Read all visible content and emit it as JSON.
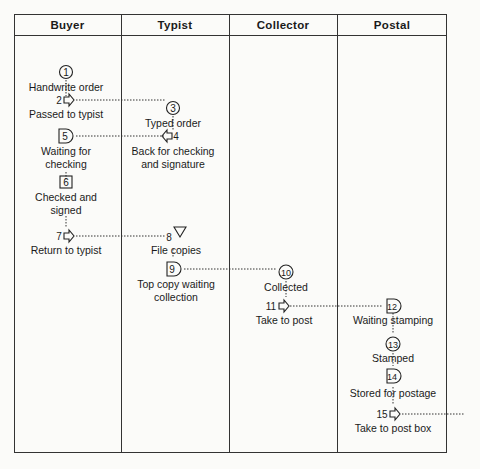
{
  "columns": [
    "Buyer",
    "Typist",
    "Collector",
    "Postal"
  ],
  "steps": [
    {
      "n": "1",
      "symbol": "operation",
      "label": "Handwrite order",
      "lane": "Buyer"
    },
    {
      "n": "2",
      "symbol": "transport",
      "label": "Passed to typist",
      "lane": "Buyer"
    },
    {
      "n": "3",
      "symbol": "operation",
      "label": "Typed order",
      "lane": "Typist"
    },
    {
      "n": "4",
      "symbol": "transport",
      "label": "Back for checking and signature",
      "lane": "Typist"
    },
    {
      "n": "5",
      "symbol": "delay",
      "label": "Waiting for checking",
      "lane": "Buyer"
    },
    {
      "n": "6",
      "symbol": "inspection",
      "label": "Checked and signed",
      "lane": "Buyer"
    },
    {
      "n": "7",
      "symbol": "transport",
      "label": "Return to typist",
      "lane": "Buyer"
    },
    {
      "n": "8",
      "symbol": "storage",
      "label": "File copies",
      "lane": "Typist"
    },
    {
      "n": "9",
      "symbol": "delay",
      "label": "Top copy waiting collection",
      "lane": "Typist"
    },
    {
      "n": "10",
      "symbol": "operation",
      "label": "Collected",
      "lane": "Collector"
    },
    {
      "n": "11",
      "symbol": "transport",
      "label": "Take to post",
      "lane": "Collector"
    },
    {
      "n": "12",
      "symbol": "delay",
      "label": "Waiting stamping",
      "lane": "Postal"
    },
    {
      "n": "13",
      "symbol": "operation",
      "label": "Stamped",
      "lane": "Postal"
    },
    {
      "n": "14",
      "symbol": "delay",
      "label": "Stored for postage",
      "lane": "Postal"
    },
    {
      "n": "15",
      "symbol": "transport",
      "label": "Take to post box",
      "lane": "Postal"
    }
  ],
  "labels": {
    "l1": "Handwrite order",
    "l2": "Passed to typist",
    "l3": "Typed order",
    "l4a": "Back for checking",
    "l4b": "and signature",
    "l5a": "Waiting for",
    "l5b": "checking",
    "l6a": "Checked and",
    "l6b": "signed",
    "l7": "Return to typist",
    "l8": "File copies",
    "l9a": "Top copy waiting",
    "l9b": "collection",
    "l10": "Collected",
    "l11": "Take to post",
    "l12": "Waiting stamping",
    "l13": "Stamped",
    "l14": "Stored for postage",
    "l15": "Take to post box"
  },
  "numbers": {
    "n1": "1",
    "n2": "2",
    "n3": "3",
    "n4": "4",
    "n5": "5",
    "n6": "6",
    "n7": "7",
    "n8": "8",
    "n9": "9",
    "n10": "10",
    "n11": "11",
    "n12": "12",
    "n13": "13",
    "n14": "14",
    "n15": "15"
  },
  "colors": {
    "line": "#333333",
    "text": "#1a1a1a",
    "background": "#fbfbf9"
  }
}
